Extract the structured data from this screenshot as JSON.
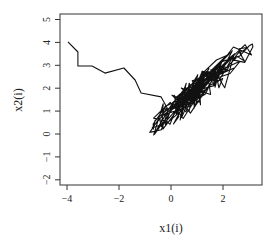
{
  "chart_data": {
    "type": "line",
    "title": "",
    "xlabel": "x1(i)",
    "ylabel": "x2(i)",
    "xlim": [
      -4.15,
      3.6
    ],
    "ylim": [
      -2.2,
      5.25
    ],
    "xticks": [
      -4,
      -2,
      0,
      2
    ],
    "xtick_labels": [
      "-4",
      "-2",
      "0",
      "2"
    ],
    "yticks": [
      -2,
      -1,
      0,
      1,
      2,
      3,
      4,
      5
    ],
    "ytick_labels": [
      "-2",
      "-1",
      "0",
      "1",
      "2",
      "3",
      "4",
      "5"
    ],
    "grid": false,
    "legend": null,
    "line_color": "#111111",
    "series": [
      {
        "name": "trajectory",
        "description": "Random-walk trajectory starting near (-4, 4) descending to a dense elongated cluster along the diagonal from about (-1, 0) to (3.1, 3.9)",
        "x": [
          -3.96,
          -3.58,
          -3.58,
          -3.04,
          -2.54,
          -1.81,
          -1.38,
          -1.15,
          -0.38,
          -0.15
        ],
        "y": [
          4.02,
          3.58,
          2.97,
          2.97,
          2.66,
          2.88,
          2.36,
          1.79,
          1.62,
          1.15
        ]
      }
    ],
    "cluster": {
      "x_range": [
        -1.08,
        3.15
      ],
      "y_range": [
        -0.04,
        3.93
      ],
      "center_line": {
        "slope": 0.95,
        "intercept": 0.95
      },
      "spread": 0.55,
      "n_points": 260,
      "seed": 7,
      "top_right_extremes": [
        [
          2.85,
          3.9
        ],
        [
          3.1,
          3.45
        ],
        [
          2.4,
          3.8
        ]
      ],
      "bottom_left_extreme": [
        -1.08,
        -0.04
      ]
    }
  }
}
